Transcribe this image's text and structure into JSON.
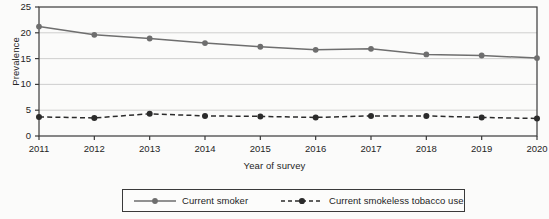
{
  "chart_data": {
    "type": "line",
    "title": "",
    "xlabel": "Year of survey",
    "ylabel": "Prevalence",
    "categories": [
      "2011",
      "2012",
      "2013",
      "2014",
      "2015",
      "2016",
      "2017",
      "2018",
      "2019",
      "2020"
    ],
    "x": [
      2011,
      2012,
      2013,
      2014,
      2015,
      2016,
      2017,
      2018,
      2019,
      2020
    ],
    "xlim": [
      2011,
      2020
    ],
    "ylim": [
      0,
      25
    ],
    "yticks": [
      0,
      5,
      10,
      15,
      20,
      25
    ],
    "ytick_labels": [
      "0",
      "5",
      "10",
      "15",
      "20",
      "25"
    ],
    "xtick_labels": [
      "2011",
      "2012",
      "2013",
      "2014",
      "2015",
      "2016",
      "2017",
      "2018",
      "2019",
      "2020"
    ],
    "grid": "horizontal",
    "legend_position": "bottom",
    "series": [
      {
        "name": "Current smoker",
        "values": [
          21.2,
          19.6,
          18.9,
          18.0,
          17.3,
          16.7,
          16.9,
          15.8,
          15.6,
          15.1
        ],
        "color": "#6e6e6e",
        "line_style": "solid",
        "marker": "circle"
      },
      {
        "name": "Current smokeless tobacco use",
        "values": [
          3.7,
          3.5,
          4.3,
          3.9,
          3.8,
          3.6,
          3.9,
          3.9,
          3.6,
          3.4
        ],
        "color": "#2b2b2b",
        "line_style": "dashed",
        "marker": "circle"
      }
    ]
  },
  "legend": {
    "entries": [
      {
        "label": "Current smoker"
      },
      {
        "label": "Current smokeless tobacco use"
      }
    ]
  },
  "colors": {
    "frame": "#3a3a3a",
    "grid": "#c9c9c9",
    "smoker": "#6e6e6e",
    "smokeless": "#2b2b2b",
    "background": "#fbfbfa"
  }
}
